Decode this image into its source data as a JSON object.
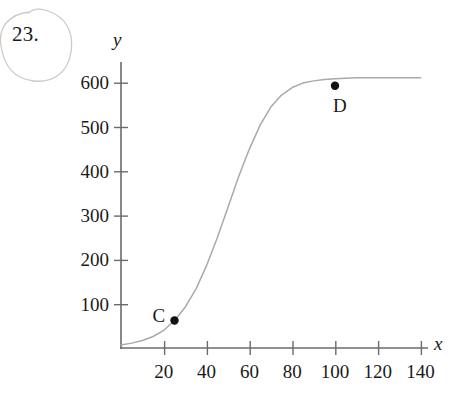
{
  "problem": {
    "number": "23.",
    "annotation": "hand-drawn-pencil-circle"
  },
  "axes": {
    "x_label": "x",
    "y_label": "y"
  },
  "chart_data": {
    "type": "line",
    "title": "",
    "subtitle": "",
    "xlabel": "x",
    "ylabel": "y",
    "grid": false,
    "legend": null,
    "xlim": [
      0,
      145
    ],
    "ylim": [
      0,
      625
    ],
    "x_ticks": [
      20,
      40,
      60,
      80,
      100,
      120,
      140
    ],
    "x_tick_labels": [
      "20",
      "40",
      "60",
      "80",
      "100",
      "120",
      "140"
    ],
    "y_ticks": [
      100,
      200,
      300,
      400,
      500,
      600
    ],
    "y_tick_labels": [
      "100",
      "200",
      "300",
      "400",
      "500",
      "600"
    ],
    "series": [
      {
        "name": "logistic-curve",
        "color": "#a9a9a9",
        "x": [
          0,
          5,
          10,
          15,
          20,
          25,
          30,
          35,
          40,
          45,
          50,
          55,
          58,
          60,
          65,
          70,
          75,
          80,
          85,
          90,
          95,
          100,
          105,
          110,
          115,
          120,
          125,
          130,
          135,
          140
        ],
        "y": [
          7,
          11,
          17,
          26,
          40,
          62,
          92,
          133,
          186,
          249,
          318,
          387,
          425,
          449,
          503,
          544,
          571,
          588,
          598,
          603,
          606,
          608,
          609,
          610,
          610,
          610,
          610,
          610,
          610,
          610
        ]
      }
    ],
    "annotations": [
      {
        "label": "C",
        "x": 25,
        "y": 62,
        "marker": "filled-circle",
        "label_position": "left"
      },
      {
        "label": "D",
        "x": 100,
        "y": 592,
        "marker": "filled-circle",
        "label_position": "below-right"
      }
    ]
  },
  "colors": {
    "axis": "#6b6b6b",
    "curve": "#a9a9a9",
    "marker": "#111111",
    "text": "#1a1a1a",
    "pencil": "#c9c6c4",
    "background": "#ffffff"
  }
}
